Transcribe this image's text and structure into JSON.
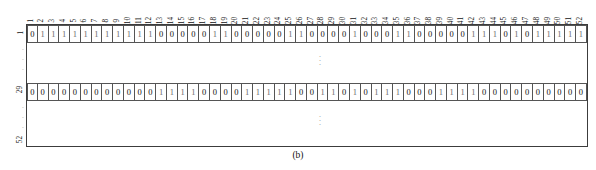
{
  "figure": {
    "caption": "(b)",
    "type": "binary-matrix-table"
  },
  "matrix": {
    "column_count": 52,
    "row_count": 52,
    "column_headers": [
      "1",
      "2",
      "3",
      "4",
      "5",
      "6",
      "7",
      "8",
      "9",
      "10",
      "11",
      "12",
      "13",
      "14",
      "15",
      "16",
      "17",
      "18",
      "19",
      "20",
      "21",
      "22",
      "23",
      "24",
      "25",
      "26",
      "27",
      "28",
      "29",
      "30",
      "31",
      "32",
      "33",
      "34",
      "35",
      "36",
      "37",
      "38",
      "39",
      "40",
      "41",
      "42",
      "43",
      "44",
      "45",
      "46",
      "47",
      "48",
      "49",
      "50",
      "51",
      "52"
    ],
    "row_labels": {
      "first": "1",
      "middle": "29",
      "last": "52",
      "ellipsis": "⋮"
    },
    "rows": [
      {
        "label": "1",
        "values": [
          0,
          1,
          1,
          1,
          1,
          1,
          1,
          1,
          1,
          1,
          1,
          1,
          0,
          0,
          0,
          0,
          0,
          1,
          1,
          0,
          0,
          0,
          0,
          0,
          1,
          1,
          0,
          0,
          0,
          0,
          1,
          0,
          0,
          0,
          1,
          1,
          0,
          0,
          0,
          0,
          0,
          1,
          1,
          1,
          0,
          1,
          0,
          1,
          1,
          1,
          1,
          1
        ]
      },
      {
        "label": "29",
        "values": [
          0,
          0,
          0,
          0,
          0,
          0,
          0,
          0,
          0,
          0,
          0,
          0,
          1,
          1,
          1,
          1,
          0,
          0,
          0,
          0,
          1,
          1,
          1,
          1,
          1,
          0,
          0,
          1,
          1,
          0,
          1,
          0,
          1,
          1,
          1,
          0,
          0,
          0,
          1,
          1,
          1,
          1,
          0,
          0,
          0,
          0,
          0,
          0,
          0,
          0,
          0,
          0
        ]
      }
    ],
    "ellipsis_marker": "⋮"
  },
  "colors": {
    "frame_border": "#3c3c3c",
    "cell_border": "#555555",
    "text": "#111111",
    "zero_text": "#0f0f0f",
    "one_text": "#6b6b6b",
    "ellipsis": "#9a9a9a",
    "background": "#ffffff"
  }
}
